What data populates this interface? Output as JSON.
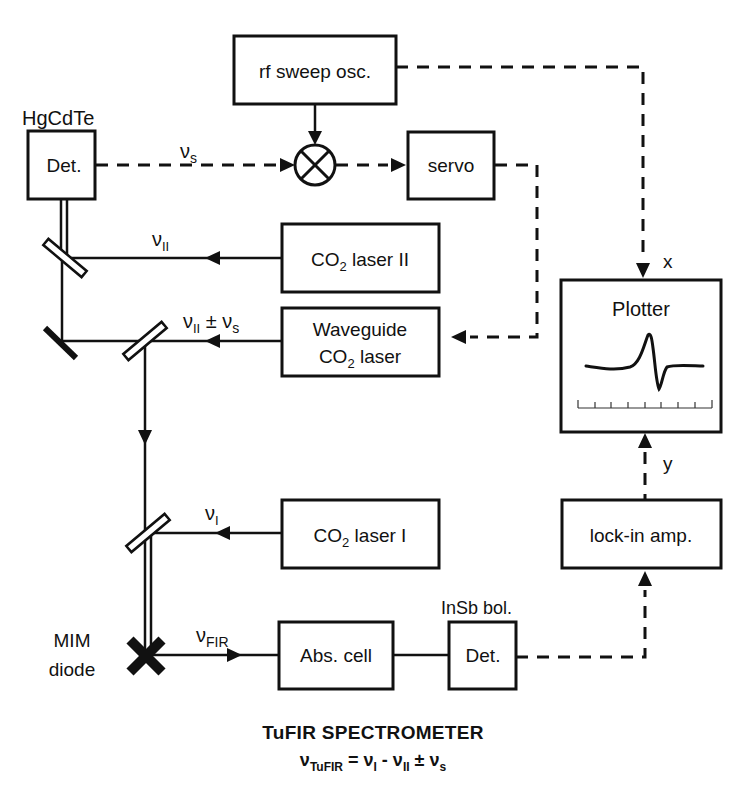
{
  "diagram": {
    "title": "TuFIR SPECTROMETER",
    "formula": {
      "lhs": "ν",
      "lhs_sub": "TuFIR",
      "eq": " = ",
      "t1": "ν",
      "t1_sub": "I",
      "op1": " - ",
      "t2": "ν",
      "t2_sub": "II",
      "op2": " ± ",
      "t3": "ν",
      "t3_sub": "s"
    },
    "blocks": {
      "rf_sweep": "rf sweep osc.",
      "hgcdte_label": "HgCdTe",
      "hgcdte_det": "Det.",
      "servo": "servo",
      "co2_laser_2_a": "CO",
      "co2_laser_2_sub": "2",
      "co2_laser_2_b": " laser II",
      "waveguide_l1": "Waveguide",
      "waveguide_l2_a": "CO",
      "waveguide_l2_sub": "2",
      "waveguide_l2_b": " laser",
      "plotter": "Plotter",
      "co2_laser_1_a": "CO",
      "co2_laser_1_sub": "2",
      "co2_laser_1_b": " laser I",
      "lockin": "lock-in amp.",
      "insb_label": "InSb bol.",
      "insb_det": "Det.",
      "abs_cell": "Abs. cell",
      "mim_l1": "MIM",
      "mim_l2": "diode"
    },
    "signals": {
      "nu_s": "ν",
      "nu_s_sub": "s",
      "nu_II": "ν",
      "nu_II_sub": "II",
      "nu_II_pm_a": "ν",
      "nu_II_pm_sub": "II",
      "nu_II_pm_op": " ± ",
      "nu_II_pm_b": "ν",
      "nu_II_pm_b_sub": "s",
      "nu_I": "ν",
      "nu_I_sub": "I",
      "nu_FIR": "ν",
      "nu_FIR_sub": "FIR",
      "x": "x",
      "y": "y"
    }
  }
}
